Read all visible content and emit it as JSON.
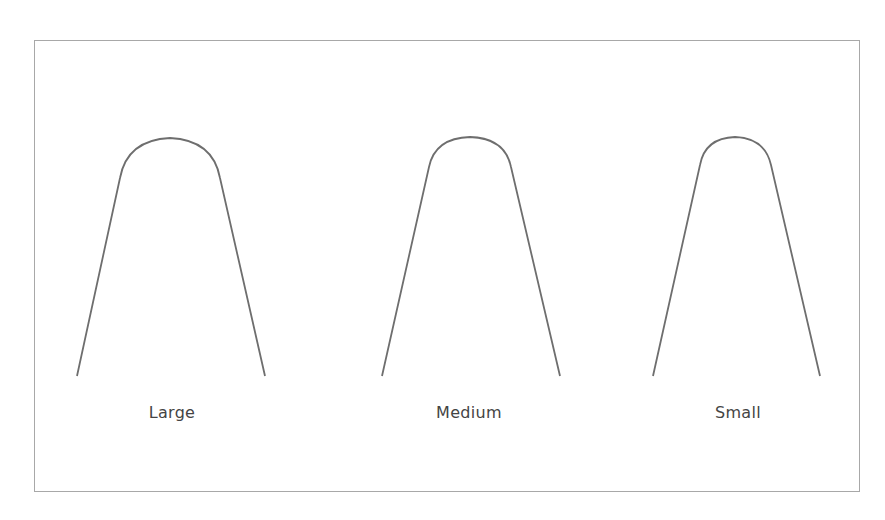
{
  "diagram": {
    "stroke_color": "#6e6e6e",
    "border_color": "#a8a8a8",
    "shapes": [
      {
        "label": "Large",
        "size": "large"
      },
      {
        "label": "Medium",
        "size": "medium"
      },
      {
        "label": "Small",
        "size": "small"
      }
    ]
  }
}
